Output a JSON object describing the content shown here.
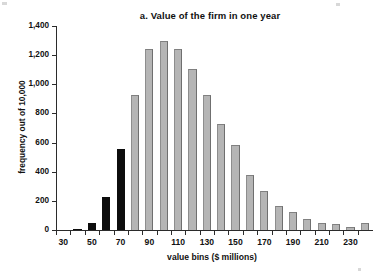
{
  "chart_data": {
    "type": "bar",
    "title": "a. Value of the firm in one year",
    "subtitle": "",
    "xlabel": "value bins ($ millions)",
    "ylabel": "frequency out of 10,000",
    "grid": false,
    "legend": null,
    "ylim": [
      0,
      1400
    ],
    "ytick_values": [
      0,
      200,
      400,
      600,
      800,
      1000,
      1200,
      1400
    ],
    "ytick_labels": [
      "0",
      "200",
      "400",
      "600",
      "800",
      "1,000",
      "1,200",
      "1,400"
    ],
    "xtick_values": [
      30,
      50,
      70,
      90,
      110,
      130,
      150,
      170,
      190,
      210,
      230
    ],
    "xtick_labels": [
      "30",
      "50",
      "70",
      "90",
      "110",
      "130",
      "150",
      "170",
      "190",
      "210",
      "230"
    ],
    "xlim": [
      25,
      245
    ],
    "bin_width": 10,
    "categories": [
      30,
      40,
      50,
      60,
      70,
      80,
      90,
      100,
      110,
      120,
      130,
      140,
      150,
      160,
      170,
      180,
      190,
      200,
      210,
      220,
      230,
      240
    ],
    "values": [
      0,
      5,
      50,
      225,
      555,
      925,
      1245,
      1295,
      1245,
      1105,
      925,
      730,
      585,
      375,
      270,
      165,
      125,
      75,
      50,
      40,
      20,
      45
    ],
    "bar_colors": [
      "black",
      "black",
      "black",
      "black",
      "black",
      "gray",
      "gray",
      "gray",
      "gray",
      "gray",
      "gray",
      "gray",
      "gray",
      "gray",
      "gray",
      "gray",
      "gray",
      "gray",
      "gray",
      "gray",
      "gray",
      "gray"
    ],
    "highlight_color": "#0d0d0d",
    "bar_color": "#b5b5b5",
    "axis_color": "#2b2b2b",
    "background": "#ffffff"
  }
}
